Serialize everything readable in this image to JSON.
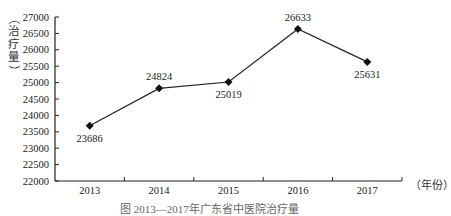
{
  "chart_data": {
    "type": "line",
    "title": "",
    "caption": "图  2013—2017年广东省中医院治疗量",
    "xlabel": "（年份）",
    "ylabel": "（治疗量）",
    "categories": [
      "2013",
      "2014",
      "2015",
      "2016",
      "2017"
    ],
    "series": [
      {
        "name": "治疗量",
        "values": [
          23686,
          24824,
          25019,
          26633,
          25631
        ]
      }
    ],
    "data_labels": [
      "23686",
      "24824",
      "25019",
      "26633",
      "25631"
    ],
    "label_positions": [
      "below",
      "above",
      "below",
      "above",
      "below"
    ],
    "ylim": [
      22000,
      27000
    ],
    "yticks": [
      22000,
      22500,
      23000,
      23500,
      24000,
      24500,
      25000,
      25500,
      26000,
      26500,
      27000
    ],
    "ytick_labels": [
      "22000",
      "22500",
      "23000",
      "23500",
      "24000",
      "24500",
      "25000",
      "25500",
      "26000",
      "26500",
      "27000"
    ],
    "grid": false,
    "legend": null,
    "marker": "diamond",
    "line_color": "#222222"
  },
  "labels": {
    "ylabel_chars": [
      "（",
      "治",
      "疗",
      "量",
      "）"
    ],
    "xunit": "（年份）",
    "caption": "图  2013—2017年广东省中医院治疗量"
  }
}
